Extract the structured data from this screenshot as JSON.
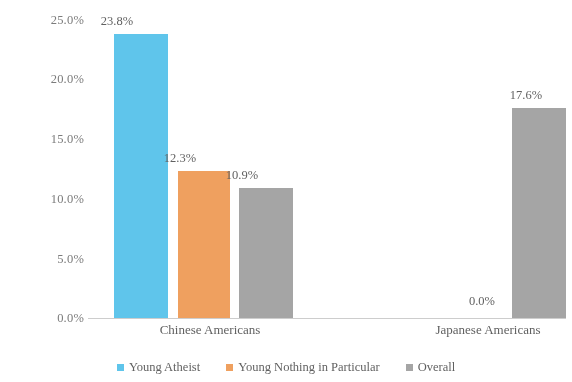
{
  "chart_data": {
    "type": "bar",
    "title": "",
    "subtitle": "",
    "xlabel": "",
    "ylabel": "",
    "categories": [
      "Chinese Americans",
      "Japanese Americans"
    ],
    "series": [
      {
        "name": "Young Atheist",
        "color": "#5bc8f0",
        "values": [
          23.8,
          0.0
        ],
        "data_labels": [
          "23.8%",
          ""
        ]
      },
      {
        "name": "Young Nothing in Particular",
        "color": "#f5a15c",
        "values": [
          12.3,
          0.0
        ],
        "data_labels": [
          "12.3%",
          "0.0%"
        ]
      },
      {
        "name": "Overall",
        "color": "#a6a6a6",
        "values": [
          10.9,
          17.6
        ],
        "data_labels": [
          "10.9%",
          "17.6%"
        ]
      }
    ],
    "ylim": [
      0,
      25
    ],
    "ytick_values": [
      0,
      5,
      10,
      15,
      20,
      25
    ],
    "ytick_labels": [
      "0.0%",
      "5.0%",
      "10.0%",
      "15.0%",
      "20.0%",
      "25.0%"
    ],
    "value_format": "percent",
    "grid": false,
    "legend_position": "bottom",
    "annotations": []
  },
  "axis": {
    "yticks": [
      {
        "label": "25.0%",
        "value": 25
      },
      {
        "label": "20.0%",
        "value": 20
      },
      {
        "label": "15.0%",
        "value": 15
      },
      {
        "label": "10.0%",
        "value": 10
      },
      {
        "label": "5.0%",
        "value": 5
      },
      {
        "label": "0.0%",
        "value": 0
      }
    ]
  },
  "groups": [
    {
      "label": "Chinese Americans",
      "bars": [
        {
          "series": "Young Atheist",
          "value_label": "23.8%"
        },
        {
          "series": "Young Nothing in Particular",
          "value_label": "12.3%"
        },
        {
          "series": "Overall",
          "value_label": "10.9%"
        }
      ]
    },
    {
      "label": "Japanese Americans",
      "bars": [
        {
          "series": "Young Nothing in Particular",
          "value_label": "0.0%"
        },
        {
          "series": "Overall",
          "value_label": "17.6%"
        }
      ]
    }
  ],
  "legend": {
    "items": [
      {
        "label": "Young Atheist",
        "color": "#5bc8f0"
      },
      {
        "label": "Young Nothing in Particular",
        "color": "#f5a15c"
      },
      {
        "label": "Overall",
        "color": "#a6a6a6"
      }
    ]
  }
}
